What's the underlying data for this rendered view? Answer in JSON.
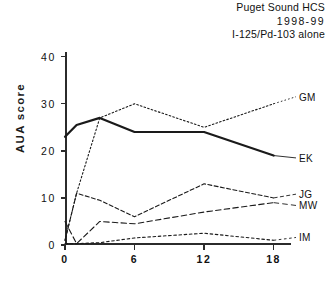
{
  "title": {
    "line1": "Puget Sound HCS",
    "line2": "1998-99",
    "line3": "I-125/Pd-103 alone"
  },
  "axis": {
    "ylabel": "AUA score",
    "xlabel": "",
    "ytick_labels": [
      "0",
      "10",
      "20",
      "30",
      "40"
    ],
    "xtick_labels": [
      "0",
      "6",
      "12",
      "18"
    ]
  },
  "chart_data": {
    "type": "line",
    "title": "Puget Sound HCS 1998-99 I-125/Pd-103 alone",
    "xlabel": "",
    "ylabel": "AUA score",
    "xlim": [
      0,
      19.5
    ],
    "ylim": [
      0,
      41
    ],
    "xticks": [
      0,
      6,
      12,
      18
    ],
    "yticks": [
      0,
      10,
      20,
      30,
      40
    ],
    "grid": false,
    "legend_position": "right-inline",
    "series": [
      {
        "name": "GM",
        "style": "dotted",
        "color": "#1a1a1a",
        "x": [
          0,
          1,
          3,
          6,
          12,
          18
        ],
        "values": [
          1,
          11,
          27,
          30,
          25,
          30
        ]
      },
      {
        "name": "EK",
        "style": "solid-thick",
        "color": "#1a1a1a",
        "x": [
          0,
          1,
          3,
          6,
          12,
          18
        ],
        "values": [
          23,
          25.5,
          27,
          24,
          24,
          19
        ]
      },
      {
        "name": "JG",
        "style": "dash-dot",
        "color": "#1a1a1a",
        "x": [
          0,
          1,
          3,
          6,
          12,
          18
        ],
        "values": [
          1,
          11,
          9.5,
          6,
          13,
          10
        ]
      },
      {
        "name": "MW",
        "style": "dashed",
        "color": "#1a1a1a",
        "x": [
          0,
          1,
          3,
          6,
          12,
          18
        ],
        "values": [
          5,
          0.3,
          5,
          4.5,
          7,
          9
        ]
      },
      {
        "name": "IM",
        "style": "fine-dotted",
        "color": "#1a1a1a",
        "x": [
          0,
          1,
          3,
          6,
          12,
          18
        ],
        "values": [
          0.3,
          0.3,
          0.5,
          1.5,
          2.5,
          1
        ]
      }
    ]
  },
  "legend": [
    {
      "label": "GM",
      "y_value": 31.5
    },
    {
      "label": "EK",
      "y_value": 18.5
    },
    {
      "label": "JG",
      "y_value": 10.8
    },
    {
      "label": "MW",
      "y_value": 8.4
    },
    {
      "label": "IM",
      "y_value": 1.6
    }
  ]
}
